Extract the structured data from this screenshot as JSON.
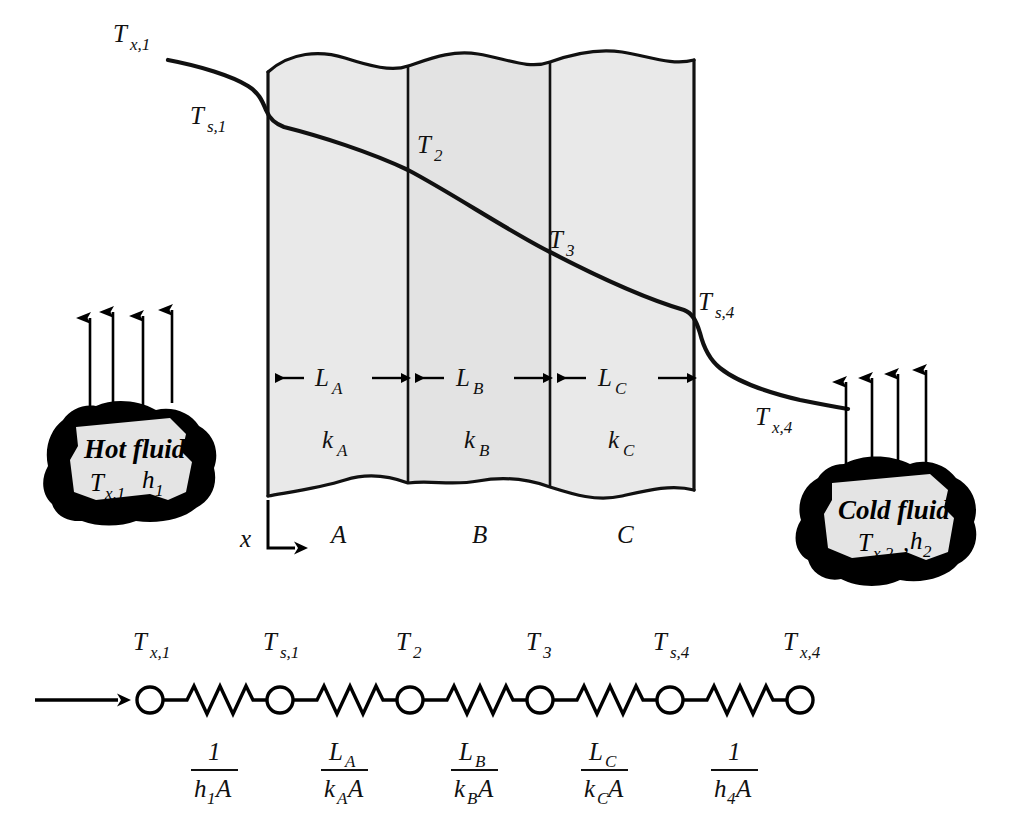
{
  "figure": {
    "axis_label": "x"
  },
  "wall": {
    "layers": [
      {
        "id": "A",
        "region_label": "A",
        "thickness_label": "L",
        "thickness_sub": "A",
        "conductivity_label": "k",
        "conductivity_sub": "A"
      },
      {
        "id": "B",
        "region_label": "B",
        "thickness_label": "L",
        "thickness_sub": "B",
        "conductivity_label": "k",
        "conductivity_sub": "B"
      },
      {
        "id": "C",
        "region_label": "C",
        "thickness_label": "L",
        "thickness_sub": "C",
        "conductivity_label": "k",
        "conductivity_sub": "C"
      }
    ]
  },
  "temperature_labels": {
    "fluid_hot": {
      "base": "T",
      "sub": "x,1"
    },
    "surface_1": {
      "base": "T",
      "sub": "s,1"
    },
    "interface_2": {
      "base": "T",
      "sub": "2"
    },
    "interface_3": {
      "base": "T",
      "sub": "3"
    },
    "surface_4": {
      "base": "T",
      "sub": "s,4"
    },
    "fluid_cold": {
      "base": "T",
      "sub": "x,4"
    }
  },
  "hot_fluid": {
    "title": "Hot fluid",
    "temperature_base": "T",
    "temperature_sub": "x,1",
    "coefficient_base": "h",
    "coefficient_sub": "1"
  },
  "cold_fluid": {
    "title": "Cold fluid",
    "temperature_base": "T",
    "temperature_sub": "x,2",
    "separator": ",",
    "coefficient_base": "h",
    "coefficient_sub": "2"
  },
  "circuit": {
    "nodes": [
      {
        "base": "T",
        "sub": "x,1"
      },
      {
        "base": "T",
        "sub": "s,1"
      },
      {
        "base": "T",
        "sub": "2"
      },
      {
        "base": "T",
        "sub": "3"
      },
      {
        "base": "T",
        "sub": "s,4"
      },
      {
        "base": "T",
        "sub": "x,4"
      }
    ],
    "resistances": [
      {
        "num_base": "1",
        "num_sub": "",
        "den_base": "h",
        "den_sub": "1",
        "den_tail": "A"
      },
      {
        "num_base": "L",
        "num_sub": "A",
        "den_base": "k",
        "den_sub": "A",
        "den_tail": "A"
      },
      {
        "num_base": "L",
        "num_sub": "B",
        "den_base": "k",
        "den_sub": "B",
        "den_tail": "A"
      },
      {
        "num_base": "L",
        "num_sub": "C",
        "den_base": "k",
        "den_sub": "C",
        "den_tail": "A"
      },
      {
        "num_base": "1",
        "num_sub": "",
        "den_base": "h",
        "den_sub": "4",
        "den_tail": "A"
      }
    ]
  },
  "colors": {
    "wall_fill": "#e9e9e9",
    "wall_fill_mid": "#e3e3e3",
    "line": "#111111",
    "blob_outline": "#000000",
    "blob_fill": "#e4e4e4"
  }
}
